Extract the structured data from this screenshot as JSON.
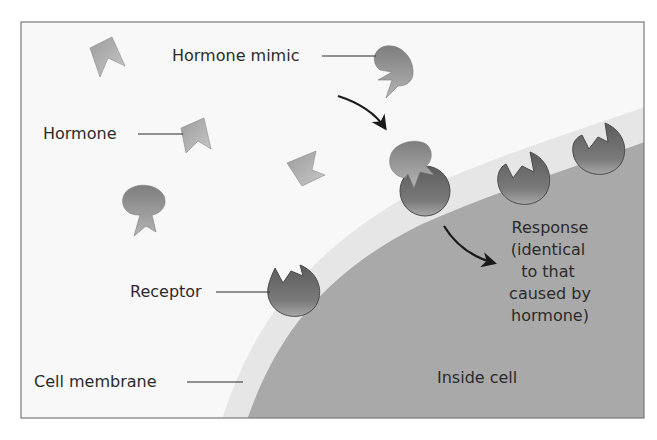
{
  "diagram": {
    "type": "biology-illustration",
    "topic": "Hormone mimic binding to cell receptor",
    "colors": {
      "background": "#ffffff",
      "outside_fluid": "#f8f8f8",
      "frame_border": "#7a7a7a",
      "membrane": "#e8e8e8",
      "cytoplasm": "#a9a9a9",
      "receptor_light": "#9a9a9a",
      "receptor_dark": "#5a5a5a",
      "hormone": "#b5b5b5",
      "mimic": "#8e8e8e",
      "arrow": "#1a1a1a",
      "text": "#2b2b2b"
    }
  },
  "labels": {
    "hormone_mimic": "Hormone mimic",
    "hormone": "Hormone",
    "receptor": "Receptor",
    "cell_membrane": "Cell membrane",
    "inside_cell": "Inside cell",
    "response_lines": [
      "Response",
      "(identical",
      "to that",
      "caused by",
      "hormone)"
    ]
  }
}
